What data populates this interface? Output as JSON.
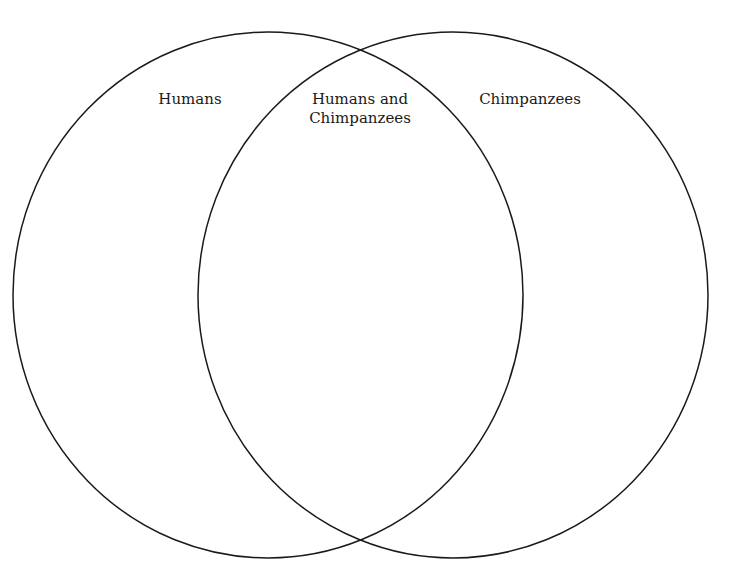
{
  "diagram": {
    "type": "venn",
    "sets": [
      {
        "label": "Humans",
        "cx": 268,
        "cy": 295,
        "rx": 255,
        "ry": 263
      },
      {
        "label": "Chimpanzees",
        "cx": 453,
        "cy": 295,
        "rx": 255,
        "ry": 263
      }
    ],
    "intersection": {
      "line1": "Humans and",
      "line2": "Chimpanzees"
    },
    "stroke_color": "#1a1a1a"
  }
}
